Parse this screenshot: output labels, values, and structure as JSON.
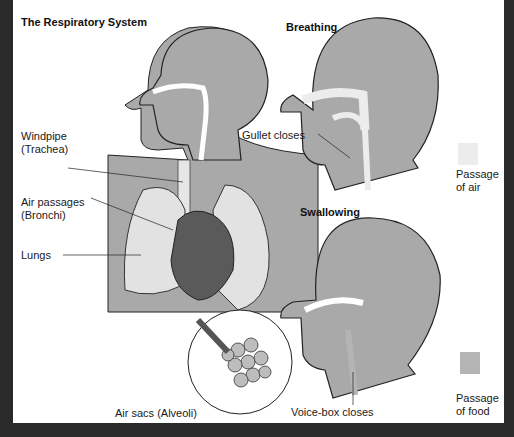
{
  "title": "The Respiratory System",
  "labels": {
    "windpipe": [
      "Windpipe",
      "(Trachea)"
    ],
    "bronchi": [
      "Air passages",
      "(Bronchi)"
    ],
    "lungs": "Lungs",
    "alveoli": "Air sacs (Alveoli)",
    "gullet": "Gullet closes",
    "voicebox": "Voice-box closes"
  },
  "panels": {
    "breathing": "Breathing",
    "swallowing": "Swallowing"
  },
  "legend": [
    {
      "label1": "Passage",
      "label2": "of air",
      "color": "#ececec"
    },
    {
      "label1": "Passage",
      "label2": "of food",
      "color": "#b4b4b4"
    }
  ],
  "colors": {
    "body": "#a9a9a9",
    "lung": "#e2e2e2",
    "heart": "#5a5a5a",
    "border": "#2a2a2a"
  }
}
